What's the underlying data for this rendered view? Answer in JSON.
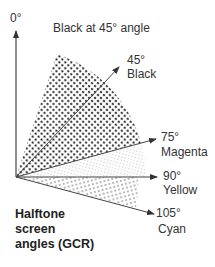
{
  "diagram": {
    "title": "Black at 45° angle",
    "axis_label": "0°",
    "origin": {
      "x": 16,
      "y": 177
    },
    "axis_top_y": 30,
    "arrows": [
      {
        "angle_label": "45°",
        "color_name": "Black",
        "tip": {
          "x": 119,
          "y": 67
        },
        "label_pos": {
          "x": 127,
          "y": 54
        }
      },
      {
        "angle_label": "75°",
        "color_name": "Magenta",
        "tip": {
          "x": 156,
          "y": 139
        },
        "label_pos": {
          "x": 161,
          "y": 132
        }
      },
      {
        "angle_label": "90°",
        "color_name": "Yellow",
        "tip": {
          "x": 157,
          "y": 177
        },
        "label_pos": {
          "x": 163,
          "y": 171
        }
      },
      {
        "angle_label": "105°",
        "color_name": "Cyan",
        "tip": {
          "x": 154,
          "y": 214
        },
        "label_pos": {
          "x": 156,
          "y": 208
        }
      }
    ],
    "caption_lines": [
      "Halftone",
      "screen",
      "angles (GCR)"
    ],
    "colors": {
      "black_dots": "#222222",
      "magenta_dots": "#c8c8c8",
      "cyan_dots": "#9a9a9a",
      "line": "#444444"
    }
  }
}
